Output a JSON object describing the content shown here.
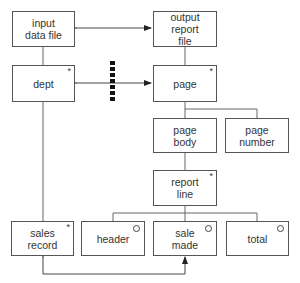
{
  "diagram": {
    "type": "Jackson structure diagram",
    "boxes": {
      "input_data_file": {
        "label": "input\ndata file",
        "marker": ""
      },
      "dept": {
        "label": "dept",
        "marker": "*"
      },
      "output_report_file": {
        "label": "output\nreport\nfile",
        "marker": ""
      },
      "page": {
        "label": "page",
        "marker": "*"
      },
      "page_body": {
        "label": "page\nbody",
        "marker": ""
      },
      "page_number": {
        "label": "page\nnumber",
        "marker": ""
      },
      "report_line": {
        "label": "report\nline",
        "marker": "*"
      },
      "sales_record": {
        "label": "sales\nrecord",
        "marker": "*"
      },
      "header": {
        "label": "header",
        "marker": "o"
      },
      "sale_made": {
        "label": "sale\nmade",
        "marker": "o"
      },
      "total": {
        "label": "total",
        "marker": "o"
      }
    },
    "connections": [
      {
        "from": "input data file",
        "to": "output report file",
        "type": "bidirectional-arrow"
      },
      {
        "from": "dept",
        "to": "page",
        "type": "bidirectional-arrow-with-clash"
      },
      {
        "from": "sales record",
        "to": "sale made",
        "type": "bidirectional-arrow"
      }
    ],
    "colors": {
      "line": "#555555",
      "text": "#333333",
      "background": "#ffffff"
    }
  }
}
